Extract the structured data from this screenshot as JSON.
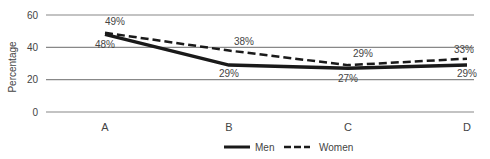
{
  "chart_data": {
    "type": "line",
    "title": "",
    "xlabel": "",
    "ylabel": "Percentage",
    "ylim": [
      0,
      60
    ],
    "yticks": [
      0,
      20,
      40,
      60
    ],
    "grid": true,
    "legend_position": "bottom",
    "categories": [
      "A",
      "B",
      "C",
      "D"
    ],
    "series": [
      {
        "name": "Men",
        "values": [
          48,
          29,
          27,
          29
        ],
        "labels": [
          "48%",
          "29%",
          "27%",
          "29%"
        ],
        "style": "solid"
      },
      {
        "name": "Women",
        "values": [
          49,
          38,
          29,
          33
        ],
        "labels": [
          "49%",
          "38%",
          "29%",
          "33%"
        ],
        "style": "dashed"
      }
    ]
  },
  "colors": {
    "line": "#1a1a1a",
    "grid": "#888888",
    "text": "#444444"
  }
}
